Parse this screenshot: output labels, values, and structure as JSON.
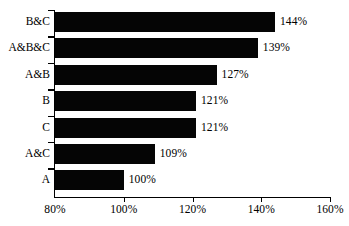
{
  "chart_data": {
    "type": "bar",
    "orientation": "horizontal",
    "title": "",
    "subtitle": "",
    "xlabel": "",
    "ylabel": "",
    "categories": [
      "B&C",
      "A&B&C",
      "A&B",
      "B",
      "C",
      "A&C",
      "A"
    ],
    "values": [
      144,
      139,
      127,
      121,
      121,
      109,
      100
    ],
    "value_labels": [
      "144%",
      "139%",
      "127%",
      "121%",
      "121%",
      "109%",
      "100%"
    ],
    "xlim": [
      80,
      160
    ],
    "xticks": [
      80,
      100,
      120,
      140,
      160
    ],
    "xtick_labels": [
      "80%",
      "100%",
      "120%",
      "140%",
      "160%"
    ],
    "grid": false,
    "legend": null,
    "bar_color": "#050505",
    "axis_color": "#000000",
    "background_color": "#ffffff",
    "annotations": []
  }
}
